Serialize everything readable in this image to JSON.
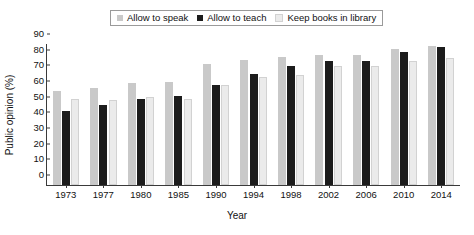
{
  "chart_data": {
    "type": "bar",
    "title": "",
    "xlabel": "Year",
    "ylabel": "Public opinion (%)",
    "ylim": [
      0,
      90
    ],
    "ytick_step": 10,
    "yticks": [
      0,
      10,
      20,
      30,
      40,
      50,
      60,
      70,
      80,
      90
    ],
    "grid": false,
    "legend_position": "top-center",
    "categories": [
      "1973",
      "1977",
      "1980",
      "1985",
      "1990",
      "1994",
      "1998",
      "2002",
      "2006",
      "2010",
      "2014"
    ],
    "series": [
      {
        "name": "Allow to speak",
        "color": "#c9c9c9",
        "values": [
          60,
          62,
          65,
          66,
          77,
          80,
          82,
          83,
          83,
          87,
          89
        ]
      },
      {
        "name": "Allow to teach",
        "color": "#1c1c1c",
        "values": [
          47,
          51,
          55,
          57,
          64,
          71,
          76,
          79,
          79,
          85,
          88
        ]
      },
      {
        "name": "Keep books in library",
        "color": "#ebebeb",
        "values": [
          55,
          54,
          56,
          55,
          64,
          69,
          70,
          76,
          76,
          79,
          81
        ]
      }
    ]
  }
}
